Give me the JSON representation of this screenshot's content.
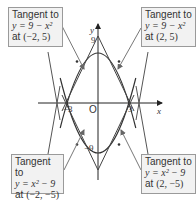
{
  "diagram": {
    "axes": {
      "x_label": "x",
      "y_label": "y",
      "origin_label": "O",
      "x_ticks": [
        "−3",
        "3"
      ],
      "y_ticks": [
        "9",
        "−9"
      ]
    },
    "curves": [
      {
        "name": "upper-parabola",
        "equation": "y = 9 − x^2"
      },
      {
        "name": "lower-parabola",
        "equation": "y = x^2 − 9"
      }
    ],
    "callouts": [
      {
        "id": "top-left",
        "title": "Tangent to",
        "equation": "y = 9 − x²",
        "at_prefix": "at ",
        "point": "(−2, 5)"
      },
      {
        "id": "top-right",
        "title": "Tangent to",
        "equation": "y = 9 − x²",
        "at_prefix": "at ",
        "point": "(2, 5)"
      },
      {
        "id": "bottom-left",
        "title": "Tangent to",
        "equation": "y = x² − 9",
        "at_prefix": "at ",
        "point": "(−2, −5)"
      },
      {
        "id": "bottom-right",
        "title": "Tangent to",
        "equation": "y = x² − 9",
        "at_prefix": "at ",
        "point": "(2, −5)"
      }
    ],
    "colors": {
      "curve": "#333333",
      "tangent": "#555555",
      "axis": "#222222",
      "box_bg": "#f2f2f2",
      "box_border": "#9a9a9a",
      "pointer": "#777777"
    }
  }
}
